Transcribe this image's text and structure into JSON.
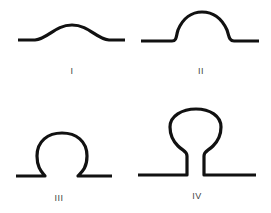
{
  "figure": {
    "panels": [
      {
        "id": "I",
        "label": "I",
        "shape": "low gentle bump"
      },
      {
        "id": "II",
        "label": "II",
        "shape": "rounded dome"
      },
      {
        "id": "III",
        "label": "III",
        "shape": "omega-shaped invagination"
      },
      {
        "id": "IV",
        "label": "IV",
        "shape": "stalked bulb (omega with neck)"
      }
    ],
    "colors": {
      "stroke": "#111111",
      "background": "#ffffff",
      "label": "#444444"
    }
  }
}
